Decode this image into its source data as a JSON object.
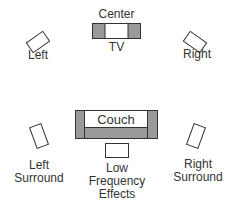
{
  "diagram": {
    "colors": {
      "stroke": "#333333",
      "shade": "#999999",
      "fill": "#ffffff"
    },
    "labels": {
      "center": "Center",
      "tv": "TV",
      "left": "Left",
      "right": "Right",
      "couch": "Couch",
      "left_surround": [
        "Left",
        "Surround"
      ],
      "right_surround": [
        "Right",
        "Surround"
      ],
      "lfe": [
        "Low",
        "Frequency",
        "Effects"
      ]
    }
  }
}
